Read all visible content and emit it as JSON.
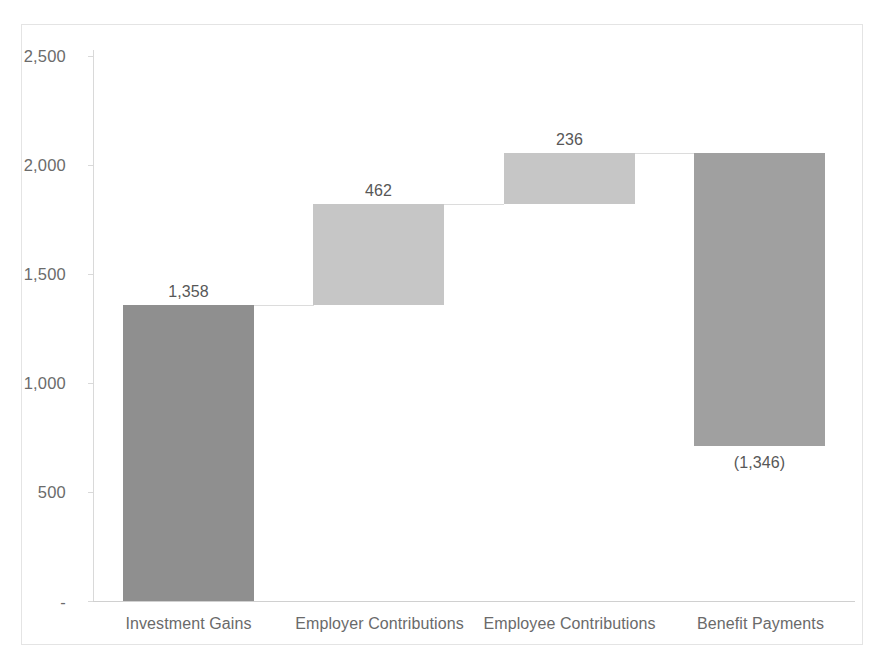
{
  "chart_data": {
    "type": "bar",
    "subtype": "waterfall",
    "title": "",
    "subtitle": "",
    "xlabel": "",
    "ylabel": "",
    "categories": [
      "Investment Gains",
      "Employer Contributions",
      "Employee Contributions",
      "Benefit Payments"
    ],
    "values": [
      1358,
      462,
      236,
      -1346
    ],
    "value_labels": [
      "1,358",
      "462",
      "236",
      "(1,346)"
    ],
    "cumulative_start": [
      0,
      1358,
      1820,
      2056
    ],
    "cumulative_end": [
      1358,
      1820,
      2056,
      710
    ],
    "bar_colors": [
      "#8f8f8f",
      "#c6c6c6",
      "#c6c6c6",
      "#a0a0a0"
    ],
    "ylim": [
      0,
      2500
    ],
    "ytick_values": [
      0,
      500,
      1000,
      1500,
      2000,
      2500
    ],
    "ytick_labels": [
      "-",
      "500",
      "1,000",
      "1,500",
      "2,000",
      "2,500"
    ],
    "grid": false,
    "legend": "none",
    "label_positions": [
      "above",
      "above",
      "above",
      "below"
    ]
  },
  "colors": {
    "background": "#ffffff",
    "frame_border": "#e4e4e4",
    "axis_line": "#d9d9d9",
    "connector": "#dcdcdc",
    "tick_text": "#6b6b6b",
    "category_text": "#6a6a6a",
    "value_text": "#575757"
  }
}
